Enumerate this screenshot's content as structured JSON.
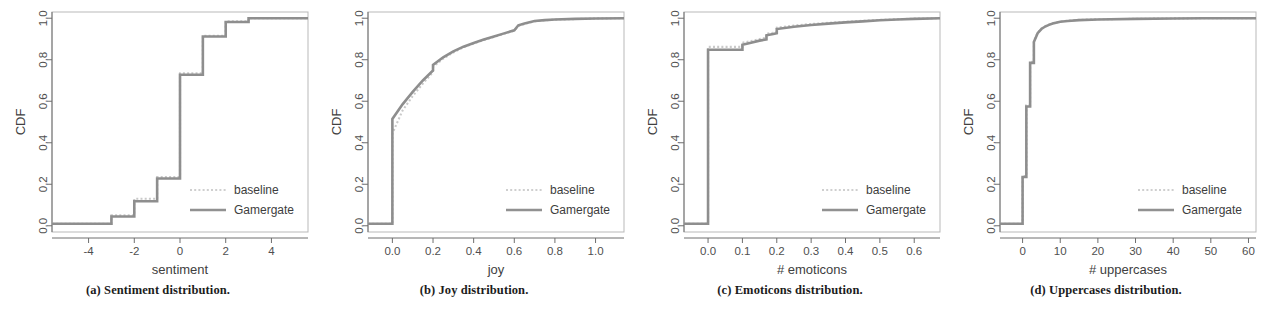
{
  "figure": {
    "legend_entries": [
      "baseline",
      "Gamergate"
    ],
    "colors": {
      "baseline": "#c9c9c9",
      "gamergate": "#8e8e8e",
      "axis": "#6e6e6e",
      "frame": "#b9b9b9"
    }
  },
  "panels": [
    {
      "key": "a",
      "caption": "(a) Sentiment distribution.",
      "legend": {
        "baseline": "baseline",
        "gamergate": "Gamergate"
      },
      "chart_data": {
        "type": "line",
        "title": "",
        "xlabel": "sentiment",
        "ylabel": "CDF",
        "xlim": [
          -5.6,
          5.6
        ],
        "ylim": [
          -0.03,
          1.03
        ],
        "xticks": [
          -4,
          -2,
          0,
          2,
          4
        ],
        "xticklabels": [
          "-4",
          "-2",
          "0",
          "2",
          "4"
        ],
        "yticks": [
          0.0,
          0.2,
          0.4,
          0.6,
          0.8,
          1.0
        ],
        "yticklabels": [
          "0.0",
          "0.2",
          "0.4",
          "0.6",
          "0.8",
          "1.0"
        ],
        "grid": false,
        "legend_position": "lower right",
        "series": [
          {
            "name": "baseline",
            "x": [
              -5.6,
              -3.0,
              -3.0,
              -2.0,
              -2.0,
              -1.0,
              -1.0,
              0.0,
              0.0,
              1.0,
              1.0,
              2.0,
              2.0,
              3.0,
              3.0,
              5.6
            ],
            "y": [
              0.01,
              0.01,
              0.05,
              0.05,
              0.13,
              0.13,
              0.235,
              0.235,
              0.735,
              0.735,
              0.915,
              0.915,
              0.985,
              0.985,
              1.0,
              1.0
            ]
          },
          {
            "name": "Gamergate",
            "x": [
              -5.6,
              -3.0,
              -3.0,
              -2.0,
              -2.0,
              -1.0,
              -1.0,
              0.0,
              0.0,
              1.0,
              1.0,
              2.0,
              2.0,
              3.0,
              3.0,
              5.6
            ],
            "y": [
              0.01,
              0.01,
              0.045,
              0.045,
              0.118,
              0.118,
              0.228,
              0.228,
              0.728,
              0.728,
              0.912,
              0.912,
              0.982,
              0.982,
              1.0,
              1.0
            ]
          }
        ]
      }
    },
    {
      "key": "b",
      "caption": "(b) Joy distribution.",
      "legend": {
        "baseline": "baseline",
        "gamergate": "Gamergate"
      },
      "chart_data": {
        "type": "line",
        "title": "",
        "xlabel": "joy",
        "ylabel": "CDF",
        "xlim": [
          -0.12,
          1.14
        ],
        "ylim": [
          -0.03,
          1.03
        ],
        "xticks": [
          0.0,
          0.2,
          0.4,
          0.6,
          0.8,
          1.0
        ],
        "xticklabels": [
          "0.0",
          "0.2",
          "0.4",
          "0.6",
          "0.8",
          "1.0"
        ],
        "yticks": [
          0.0,
          0.2,
          0.4,
          0.6,
          0.8,
          1.0
        ],
        "yticklabels": [
          "0.0",
          "0.2",
          "0.4",
          "0.6",
          "0.8",
          "1.0"
        ],
        "grid": false,
        "legend_position": "lower right",
        "series": [
          {
            "name": "baseline",
            "x": [
              -0.12,
              0.0,
              0.0,
              0.05,
              0.1,
              0.15,
              0.2,
              0.2,
              0.25,
              0.3,
              0.35,
              0.4,
              0.45,
              0.5,
              0.55,
              0.6,
              0.62,
              0.65,
              0.7,
              0.75,
              0.8,
              0.9,
              1.0,
              1.14
            ],
            "y": [
              0.01,
              0.01,
              0.445,
              0.555,
              0.625,
              0.685,
              0.74,
              0.765,
              0.805,
              0.835,
              0.86,
              0.878,
              0.895,
              0.91,
              0.925,
              0.94,
              0.962,
              0.972,
              0.985,
              0.99,
              0.993,
              0.996,
              0.999,
              1.0
            ]
          },
          {
            "name": "Gamergate",
            "x": [
              -0.12,
              0.0,
              0.0,
              0.05,
              0.1,
              0.15,
              0.2,
              0.2,
              0.25,
              0.3,
              0.35,
              0.4,
              0.45,
              0.5,
              0.55,
              0.6,
              0.62,
              0.65,
              0.7,
              0.75,
              0.8,
              0.9,
              1.0,
              1.14
            ],
            "y": [
              0.01,
              0.01,
              0.515,
              0.585,
              0.645,
              0.7,
              0.748,
              0.775,
              0.812,
              0.84,
              0.863,
              0.881,
              0.897,
              0.912,
              0.927,
              0.942,
              0.966,
              0.975,
              0.987,
              0.991,
              0.994,
              0.997,
              0.999,
              1.0
            ]
          }
        ]
      }
    },
    {
      "key": "c",
      "caption": "(c) Emoticons distribution.",
      "legend": {
        "baseline": "baseline",
        "gamergate": "Gamergate"
      },
      "chart_data": {
        "type": "line",
        "title": "",
        "xlabel": "# emoticons",
        "ylabel": "CDF",
        "xlim": [
          -0.07,
          0.675
        ],
        "ylim": [
          -0.03,
          1.03
        ],
        "xticks": [
          0.0,
          0.1,
          0.2,
          0.3,
          0.4,
          0.5,
          0.6
        ],
        "xticklabels": [
          "0.0",
          "0.1",
          "0.2",
          "0.3",
          "0.4",
          "0.5",
          "0.6"
        ],
        "yticks": [
          0.0,
          0.2,
          0.4,
          0.6,
          0.8,
          1.0
        ],
        "yticklabels": [
          "0.0",
          "0.2",
          "0.4",
          "0.6",
          "0.8",
          "1.0"
        ],
        "grid": false,
        "legend_position": "lower right",
        "series": [
          {
            "name": "baseline",
            "x": [
              -0.07,
              0.0,
              0.0,
              0.1,
              0.1,
              0.125,
              0.15,
              0.17,
              0.17,
              0.19,
              0.2,
              0.2,
              0.25,
              0.3,
              0.35,
              0.4,
              0.45,
              0.5,
              0.55,
              0.6,
              0.675
            ],
            "y": [
              0.01,
              0.01,
              0.862,
              0.862,
              0.882,
              0.89,
              0.9,
              0.906,
              0.925,
              0.93,
              0.935,
              0.955,
              0.965,
              0.972,
              0.978,
              0.983,
              0.988,
              0.992,
              0.995,
              0.998,
              1.0
            ]
          },
          {
            "name": "Gamergate",
            "x": [
              -0.07,
              0.0,
              0.0,
              0.1,
              0.1,
              0.125,
              0.15,
              0.17,
              0.17,
              0.19,
              0.2,
              0.2,
              0.25,
              0.3,
              0.35,
              0.4,
              0.45,
              0.5,
              0.55,
              0.6,
              0.675
            ],
            "y": [
              0.01,
              0.01,
              0.848,
              0.848,
              0.872,
              0.882,
              0.892,
              0.898,
              0.918,
              0.924,
              0.928,
              0.948,
              0.959,
              0.967,
              0.974,
              0.98,
              0.985,
              0.99,
              0.994,
              0.997,
              1.0
            ]
          }
        ]
      }
    },
    {
      "key": "d",
      "caption": "(d) Uppercases distribution.",
      "legend": {
        "baseline": "baseline",
        "gamergate": "Gamergate"
      },
      "chart_data": {
        "type": "line",
        "title": "",
        "xlabel": "# uppercases",
        "ylabel": "CDF",
        "xlim": [
          -6,
          62
        ],
        "ylim": [
          -0.03,
          1.03
        ],
        "xticks": [
          0,
          10,
          20,
          30,
          40,
          50,
          60
        ],
        "xticklabels": [
          "0",
          "10",
          "20",
          "30",
          "40",
          "50",
          "60"
        ],
        "yticks": [
          0.0,
          0.2,
          0.4,
          0.6,
          0.8,
          1.0
        ],
        "yticklabels": [
          "0.0",
          "0.2",
          "0.4",
          "0.6",
          "0.8",
          "1.0"
        ],
        "grid": false,
        "legend_position": "lower right",
        "series": [
          {
            "name": "baseline",
            "x": [
              -6,
              0,
              0,
              1,
              1,
              2,
              2,
              3,
              3,
              4,
              5,
              6,
              7,
              8,
              10,
              12,
              15,
              20,
              30,
              40,
              48,
              62
            ],
            "y": [
              0.01,
              0.01,
              0.24,
              0.24,
              0.58,
              0.58,
              0.79,
              0.79,
              0.89,
              0.93,
              0.95,
              0.962,
              0.97,
              0.976,
              0.984,
              0.988,
              0.992,
              0.995,
              0.997,
              0.999,
              1.0,
              1.0
            ]
          },
          {
            "name": "Gamergate",
            "x": [
              -6,
              0,
              0,
              1,
              1,
              2,
              2,
              3,
              3,
              4,
              5,
              6,
              7,
              8,
              10,
              12,
              15,
              20,
              30,
              40,
              48,
              62
            ],
            "y": [
              0.01,
              0.01,
              0.235,
              0.235,
              0.575,
              0.575,
              0.785,
              0.785,
              0.885,
              0.928,
              0.948,
              0.96,
              0.968,
              0.975,
              0.983,
              0.987,
              0.991,
              0.994,
              0.997,
              0.999,
              1.0,
              1.0
            ]
          }
        ]
      }
    }
  ]
}
